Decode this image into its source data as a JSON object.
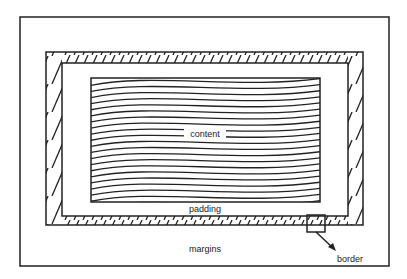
{
  "diagram": {
    "type": "css-box-model",
    "labels": {
      "content": "content",
      "padding": "padding",
      "margins": "margins",
      "border": "border"
    },
    "layers": [
      "margins",
      "border",
      "padding",
      "content"
    ],
    "colors": {
      "stroke": "#222222",
      "background": "#ffffff"
    }
  }
}
